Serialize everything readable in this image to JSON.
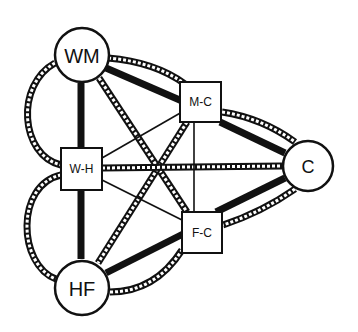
{
  "diagram": {
    "type": "network-graph",
    "colors": {
      "background": "#ffffff",
      "stroke": "#111111",
      "node_fill": "#ffffff"
    },
    "nodes": [
      {
        "id": "WM",
        "label": "WM",
        "shape": "circle"
      },
      {
        "id": "M-C",
        "label": "M-C",
        "shape": "square"
      },
      {
        "id": "W-H",
        "label": "W-H",
        "shape": "square"
      },
      {
        "id": "C",
        "label": "C",
        "shape": "circle"
      },
      {
        "id": "F-C",
        "label": "F-C",
        "shape": "square"
      },
      {
        "id": "HF",
        "label": "HF",
        "shape": "circle"
      }
    ],
    "edges": [
      {
        "from": "WM",
        "to": "M-C",
        "style": "thick-solid"
      },
      {
        "from": "WM",
        "to": "M-C",
        "style": "dotted-curve"
      },
      {
        "from": "WM",
        "to": "W-H",
        "style": "thick-solid"
      },
      {
        "from": "WM",
        "to": "W-H",
        "style": "dotted-curve"
      },
      {
        "from": "WM",
        "to": "F-C",
        "style": "dotted"
      },
      {
        "from": "M-C",
        "to": "C",
        "style": "thick-solid"
      },
      {
        "from": "M-C",
        "to": "C",
        "style": "dotted-curve"
      },
      {
        "from": "M-C",
        "to": "HF",
        "style": "dotted"
      },
      {
        "from": "M-C",
        "to": "W-H",
        "style": "thin-solid"
      },
      {
        "from": "M-C",
        "to": "F-C",
        "style": "thin-solid"
      },
      {
        "from": "W-H",
        "to": "C",
        "style": "dotted"
      },
      {
        "from": "W-H",
        "to": "F-C",
        "style": "thin-solid"
      },
      {
        "from": "W-H",
        "to": "HF",
        "style": "thick-solid"
      },
      {
        "from": "W-H",
        "to": "HF",
        "style": "dotted-curve"
      },
      {
        "from": "C",
        "to": "F-C",
        "style": "thick-solid"
      },
      {
        "from": "C",
        "to": "F-C",
        "style": "dotted-curve"
      },
      {
        "from": "HF",
        "to": "F-C",
        "style": "thick-solid"
      },
      {
        "from": "HF",
        "to": "F-C",
        "style": "dotted-curve"
      }
    ]
  }
}
